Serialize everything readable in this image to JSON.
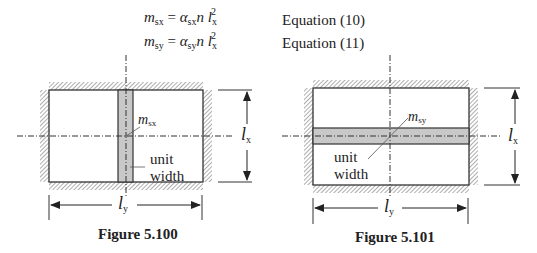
{
  "equations": [
    {
      "lhs": "m",
      "lhs_sub": "sx",
      "coef": "α",
      "coef_sub": "sx",
      "rest": "n l",
      "rest_sub": "x",
      "power": "2",
      "label": "Equation (10)"
    },
    {
      "lhs": "m",
      "lhs_sub": "sy",
      "coef": "α",
      "coef_sub": "sy",
      "rest": "n l",
      "rest_sub": "x",
      "power": "2",
      "label": "Equation (11)"
    }
  ],
  "figures": [
    {
      "caption": "Figure 5.100",
      "moment_label": "m",
      "moment_sub": "sx",
      "strip_label_line1": "unit",
      "strip_label_line2": "width",
      "dim_horizontal": "l",
      "dim_horizontal_sub": "y",
      "dim_vertical": "l",
      "dim_vertical_sub": "x",
      "strip_orientation": "vertical"
    },
    {
      "caption": "Figure 5.101",
      "moment_label": "m",
      "moment_sub": "sy",
      "strip_label_line1": "unit",
      "strip_label_line2": "width",
      "dim_horizontal": "l",
      "dim_horizontal_sub": "y",
      "dim_vertical": "l",
      "dim_vertical_sub": "x",
      "strip_orientation": "horizontal"
    }
  ],
  "colors": {
    "strip_fill": "#c8c8c8",
    "line": "#333333",
    "hatch": "#666666"
  }
}
